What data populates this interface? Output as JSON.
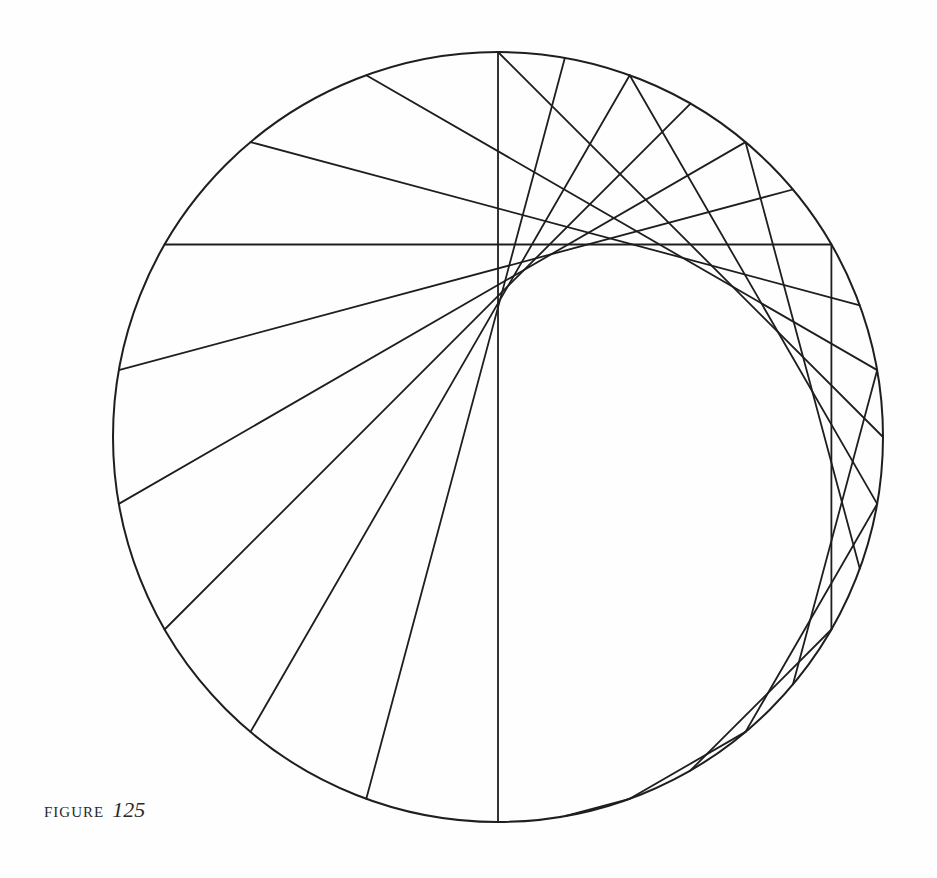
{
  "figure": {
    "caption_label": "FIGURE",
    "caption_number": "125",
    "stroke_color": "#1e1e1e",
    "background_color": "#fefefe",
    "circle": {
      "cx": 498,
      "cy": 437,
      "r": 385,
      "stroke_width": 2
    },
    "construction": {
      "description": "Chords joining point at angle θ to point at angle 2θ + 90° (cardioid envelope)",
      "source_angles_deg": [
        90,
        80,
        70,
        60,
        50,
        40,
        30,
        20,
        10,
        0,
        -10,
        -20,
        -30,
        -40,
        -50,
        -60,
        -70,
        -80
      ],
      "multiplier": 2,
      "offset_deg": 90,
      "chord_stroke_width": 1.8
    }
  }
}
